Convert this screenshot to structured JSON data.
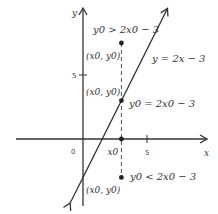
{
  "figure": {
    "axes": {
      "x_label": "x",
      "y_label": "y",
      "origin_label": "0",
      "x_tick_label": "5",
      "y_tick_label": "5",
      "x_tick_value": 5,
      "y_tick_value": 5
    },
    "line": {
      "equation_label": "y = 2x − 3",
      "slope": 2,
      "intercept": -3,
      "x_range": [
        -1,
        6.6
      ]
    },
    "x0": 3,
    "x0_label": "x0",
    "points": [
      {
        "id": "above",
        "x": 3,
        "y": 7.5,
        "coord_label": "(x0, y0)",
        "condition_label": "y0 > 2x0 − 3"
      },
      {
        "id": "on",
        "x": 3,
        "y": 3,
        "coord_label": "(x0, y0)",
        "condition_label": "y0 = 2x0 − 3"
      },
      {
        "id": "below",
        "x": 3,
        "y": -3,
        "coord_label": "(x0, y0)",
        "condition_label": "y0 < 2x0 − 3"
      },
      {
        "id": "axis",
        "x": 3,
        "y": 0
      }
    ],
    "colors": {
      "ink": "#333333",
      "dashed": "#555555"
    }
  }
}
